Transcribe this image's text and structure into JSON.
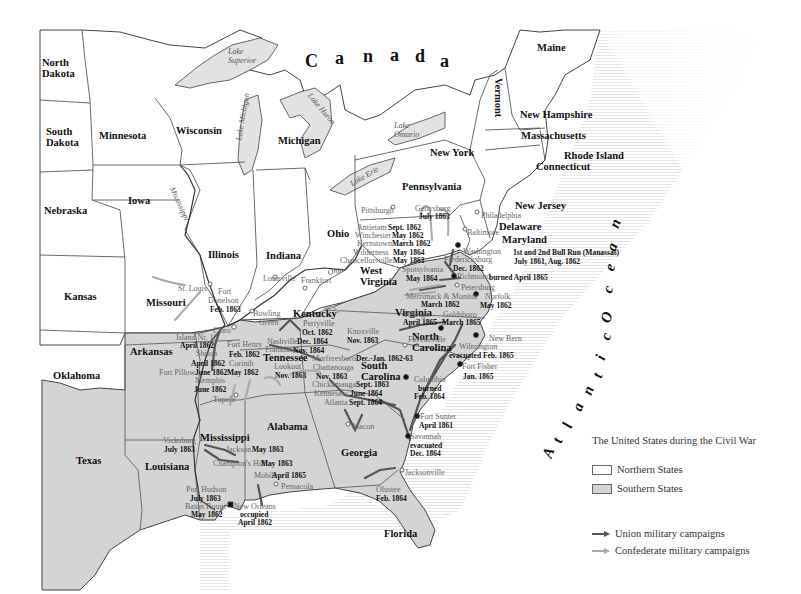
{
  "map": {
    "country_label": [
      "C",
      "a",
      "n",
      "a",
      "d",
      "a"
    ],
    "ocean_label": [
      "A",
      "t",
      "l",
      "a",
      "n",
      "t",
      "i",
      "c",
      " ",
      "O",
      "c",
      "e",
      "a",
      "n"
    ],
    "colors": {
      "northern_fill": "#ffffff",
      "southern_fill": "#d4d4d4",
      "border": "#444444",
      "lake_fill": "#e2e2e2",
      "union_arrow": "#555555",
      "confederate_arrow": "#aaaaaa"
    },
    "states": [
      {
        "name": "North Dakota",
        "x": 42,
        "y": 58,
        "lines": [
          "North",
          "Dakota"
        ]
      },
      {
        "name": "South Dakota",
        "x": 46,
        "y": 127,
        "lines": [
          "South",
          "Dakota"
        ]
      },
      {
        "name": "Minnesota",
        "x": 99,
        "y": 131,
        "lines": [
          "Minnesota"
        ]
      },
      {
        "name": "Wisconsin",
        "x": 176,
        "y": 126,
        "lines": [
          "Wisconsin"
        ]
      },
      {
        "name": "Michigan",
        "x": 278,
        "y": 136,
        "lines": [
          "Michigan"
        ]
      },
      {
        "name": "Iowa",
        "x": 128,
        "y": 196,
        "lines": [
          "Iowa"
        ]
      },
      {
        "name": "Nebraska",
        "x": 44,
        "y": 206,
        "lines": [
          "Nebraska"
        ]
      },
      {
        "name": "Illinois",
        "x": 208,
        "y": 250,
        "lines": [
          "Illinois"
        ]
      },
      {
        "name": "Indiana",
        "x": 266,
        "y": 251,
        "lines": [
          "Indiana"
        ]
      },
      {
        "name": "Ohio",
        "x": 327,
        "y": 229,
        "lines": [
          "Ohio"
        ]
      },
      {
        "name": "Pennsylvania",
        "x": 402,
        "y": 182,
        "lines": [
          "Pennsylvania"
        ]
      },
      {
        "name": "New York",
        "x": 430,
        "y": 148,
        "lines": [
          "New York"
        ]
      },
      {
        "name": "Vermont",
        "x": 503,
        "y": 78,
        "lines": [
          "Vermont"
        ],
        "rotate": 90
      },
      {
        "name": "Maine",
        "x": 537,
        "y": 43,
        "lines": [
          "Maine"
        ]
      },
      {
        "name": "New Hampshire",
        "x": 520,
        "y": 110,
        "lines": [
          "New Hampshire"
        ]
      },
      {
        "name": "Massachusetts",
        "x": 521,
        "y": 131,
        "lines": [
          "Massachusetts"
        ]
      },
      {
        "name": "Rhode Island",
        "x": 564,
        "y": 151,
        "lines": [
          "Rhode Island"
        ]
      },
      {
        "name": "Connecticut",
        "x": 536,
        "y": 162,
        "lines": [
          "Connecticut"
        ]
      },
      {
        "name": "New Jersey",
        "x": 515,
        "y": 201,
        "lines": [
          "New Jersey"
        ]
      },
      {
        "name": "Delaware",
        "x": 499,
        "y": 222,
        "lines": [
          "Delaware"
        ]
      },
      {
        "name": "Maryland",
        "x": 502,
        "y": 235,
        "lines": [
          "Maryland"
        ]
      },
      {
        "name": "West Virginia",
        "x": 360,
        "y": 266,
        "lines": [
          "West",
          "Virginia"
        ]
      },
      {
        "name": "Virginia",
        "x": 395,
        "y": 308,
        "lines": [
          "Virginia"
        ]
      },
      {
        "name": "Kansas",
        "x": 64,
        "y": 292,
        "lines": [
          "Kansas"
        ]
      },
      {
        "name": "Missouri",
        "x": 146,
        "y": 298,
        "lines": [
          "Missouri"
        ]
      },
      {
        "name": "Kentucky",
        "x": 293,
        "y": 309,
        "lines": [
          "Kentucky"
        ]
      },
      {
        "name": "North Carolina",
        "x": 412,
        "y": 332,
        "lines": [
          "North",
          "Carolina"
        ]
      },
      {
        "name": "Tennessee",
        "x": 263,
        "y": 353,
        "lines": [
          "Tennessee"
        ]
      },
      {
        "name": "South Carolina",
        "x": 361,
        "y": 361,
        "lines": [
          "South",
          "Carolina"
        ]
      },
      {
        "name": "Arkansas",
        "x": 130,
        "y": 347,
        "lines": [
          "Arkansas"
        ]
      },
      {
        "name": "Oklahoma",
        "x": 53,
        "y": 371,
        "lines": [
          "Oklahoma"
        ]
      },
      {
        "name": "Alabama",
        "x": 267,
        "y": 422,
        "lines": [
          "Alabama"
        ]
      },
      {
        "name": "Mississippi",
        "x": 200,
        "y": 433,
        "lines": [
          "Mississippi"
        ]
      },
      {
        "name": "Georgia",
        "x": 341,
        "y": 448,
        "lines": [
          "Georgia"
        ]
      },
      {
        "name": "Texas",
        "x": 76,
        "y": 456,
        "lines": [
          "Texas"
        ]
      },
      {
        "name": "Louisiana",
        "x": 145,
        "y": 462,
        "lines": [
          "Louisiana"
        ]
      },
      {
        "name": "Florida",
        "x": 384,
        "y": 529,
        "lines": [
          "Florida"
        ]
      }
    ],
    "waters": [
      {
        "name": "Lake Superior",
        "lines": [
          "Lake",
          "Superior"
        ],
        "x": 228,
        "y": 48
      },
      {
        "name": "Lake Huron",
        "lines": [
          "Lake Huron"
        ],
        "x": 312,
        "y": 92,
        "rotate": 50
      },
      {
        "name": "Lake Michigan",
        "lines": [
          "Lake Michigan"
        ],
        "x": 235,
        "y": 140,
        "rotate": -80
      },
      {
        "name": "Lake Ontario",
        "lines": [
          "Lake",
          "Ontario"
        ],
        "x": 394,
        "y": 122
      },
      {
        "name": "Lake Erie",
        "lines": [
          "Lake Erie"
        ],
        "x": 349,
        "y": 181,
        "rotate": -30
      },
      {
        "name": "Mississippi",
        "lines": [
          "Mississippi"
        ],
        "x": 175,
        "y": 186,
        "rotate": 65
      },
      {
        "name": "Ohio River",
        "lines": [
          "Ohio"
        ],
        "x": 327,
        "y": 269,
        "rotate": -10
      }
    ],
    "events": [
      {
        "place": "St. Louis",
        "x": 178,
        "y": 285
      },
      {
        "place": "Fort",
        "x": 218,
        "y": 288
      },
      {
        "place": "Donelson",
        "x": 208,
        "y": 297
      },
      {
        "date": "Feb. 1863",
        "x": 210,
        "y": 306
      },
      {
        "place": "Island Nr. 10",
        "x": 176,
        "y": 334
      },
      {
        "date": "April 1862",
        "x": 180,
        "y": 342
      },
      {
        "place": "Cairo",
        "x": 213,
        "y": 327
      },
      {
        "place": "Fort Henry",
        "x": 227,
        "y": 341
      },
      {
        "date": "Feb. 1862",
        "x": 229,
        "y": 351
      },
      {
        "place": "Shiloh",
        "x": 196,
        "y": 350
      },
      {
        "date": "April 1862",
        "x": 191,
        "y": 360
      },
      {
        "place": "Corinth",
        "x": 229,
        "y": 360
      },
      {
        "date": "May 1862",
        "x": 227,
        "y": 369
      },
      {
        "place": "Fort Pillow",
        "x": 159,
        "y": 369
      },
      {
        "date": "June 1862",
        "x": 195,
        "y": 369
      },
      {
        "place": "Memphis",
        "x": 195,
        "y": 377
      },
      {
        "date": "June 1862",
        "x": 194,
        "y": 386
      },
      {
        "place": "Tupelo",
        "x": 213,
        "y": 396
      },
      {
        "place": "Louisville",
        "x": 263,
        "y": 275
      },
      {
        "place": "Frankfort",
        "x": 301,
        "y": 277
      },
      {
        "place": "Bowling",
        "x": 253,
        "y": 310
      },
      {
        "place": "Green",
        "x": 259,
        "y": 319
      },
      {
        "place": "Perryville",
        "x": 303,
        "y": 320
      },
      {
        "date": "Oct. 1862",
        "x": 302,
        "y": 329
      },
      {
        "place": "Nashville",
        "x": 267,
        "y": 338
      },
      {
        "date": "Dec. 1864",
        "x": 297,
        "y": 338
      },
      {
        "place": "Franklin",
        "x": 265,
        "y": 346
      },
      {
        "date": "Nov. 1864",
        "x": 293,
        "y": 347
      },
      {
        "place": "Lookout",
        "x": 274,
        "y": 363
      },
      {
        "date": "Nov. 1863",
        "x": 275,
        "y": 372
      },
      {
        "place": "Murfreesboro",
        "x": 312,
        "y": 355
      },
      {
        "date": "Dec.-Jan. 1862-63",
        "x": 356,
        "y": 355
      },
      {
        "place": "Chattanooga",
        "x": 313,
        "y": 364
      },
      {
        "date": "Nov. 1863",
        "x": 316,
        "y": 373
      },
      {
        "place": "Knoxville",
        "x": 347,
        "y": 328
      },
      {
        "date": "Nov. 1863",
        "x": 347,
        "y": 337
      },
      {
        "place": "Chickamauga",
        "x": 312,
        "y": 381
      },
      {
        "date": "Sept. 1863",
        "x": 356,
        "y": 381
      },
      {
        "place": "Kennesaw",
        "x": 314,
        "y": 390
      },
      {
        "date": "June 1864",
        "x": 350,
        "y": 390
      },
      {
        "place": "Atlanta",
        "x": 324,
        "y": 399
      },
      {
        "date": "Sept. 1864",
        "x": 349,
        "y": 399
      },
      {
        "place": "Macon",
        "x": 352,
        "y": 423
      },
      {
        "place": "Pittsburgh",
        "x": 361,
        "y": 207
      },
      {
        "place": "Gettysburg",
        "x": 415,
        "y": 205
      },
      {
        "date": "July 1863",
        "x": 419,
        "y": 213
      },
      {
        "place": "Antietam",
        "x": 357,
        "y": 224
      },
      {
        "date": "Sept. 1862",
        "x": 388,
        "y": 224
      },
      {
        "place": "Winchester",
        "x": 355,
        "y": 232
      },
      {
        "date": "May 1862",
        "x": 392,
        "y": 232
      },
      {
        "place": "Kernstown",
        "x": 357,
        "y": 240
      },
      {
        "date": "March 1862",
        "x": 392,
        "y": 240
      },
      {
        "place": "Wilderness",
        "x": 353,
        "y": 249
      },
      {
        "date": "May 1864",
        "x": 393,
        "y": 249
      },
      {
        "place": "Chancellorsville",
        "x": 340,
        "y": 257
      },
      {
        "date": "May 1863",
        "x": 393,
        "y": 257
      },
      {
        "place": "Philadelphia",
        "x": 481,
        "y": 212
      },
      {
        "place": "Baltimore",
        "x": 467,
        "y": 229
      },
      {
        "place": "Washington",
        "x": 463,
        "y": 248
      },
      {
        "place": "Fredericksburg",
        "x": 444,
        "y": 256
      },
      {
        "date": "Dec. 1862",
        "x": 453,
        "y": 265
      },
      {
        "place": "Spotsylvania",
        "x": 402,
        "y": 266
      },
      {
        "date": "May 1864",
        "x": 406,
        "y": 275
      },
      {
        "place": "Richmond",
        "x": 457,
        "y": 273
      },
      {
        "place": "Petersburg",
        "x": 461,
        "y": 284
      },
      {
        "place": "Merrimack & Monitor",
        "x": 406,
        "y": 293
      },
      {
        "date": "March 1862",
        "x": 421,
        "y": 301
      },
      {
        "place": "Norfolk",
        "x": 485,
        "y": 293
      },
      {
        "date": "May 1862",
        "x": 480,
        "y": 302
      },
      {
        "place": "Raleigh",
        "x": 404,
        "y": 311
      },
      {
        "date": "April 1865",
        "x": 403,
        "y": 319
      },
      {
        "place": "Goldsboro",
        "x": 443,
        "y": 311
      },
      {
        "date": "March 1865",
        "x": 442,
        "y": 319
      },
      {
        "place": "Fayetteville",
        "x": 408,
        "y": 336
      },
      {
        "place": "New Bern",
        "x": 489,
        "y": 335
      },
      {
        "place": "Wilmington",
        "x": 459,
        "y": 343
      },
      {
        "place": "Fort Fisher",
        "x": 462,
        "y": 363
      },
      {
        "date": "Jan. 1865",
        "x": 463,
        "y": 373
      },
      {
        "date": "evacuated Feb. 1865",
        "x": 449,
        "y": 352
      },
      {
        "place": "Columbia",
        "x": 414,
        "y": 376
      },
      {
        "date": "burned",
        "x": 418,
        "y": 385
      },
      {
        "date": "Feb. 1864",
        "x": 414,
        "y": 393
      },
      {
        "place": "Fort Sunter",
        "x": 420,
        "y": 413
      },
      {
        "date": "April 1861",
        "x": 419,
        "y": 422
      },
      {
        "place": "Savannah",
        "x": 410,
        "y": 433
      },
      {
        "date": "evacuated",
        "x": 410,
        "y": 442
      },
      {
        "date": "Dec. 1864",
        "x": 410,
        "y": 450
      },
      {
        "place": "Jacksonville",
        "x": 405,
        "y": 469
      },
      {
        "place": "Olustee",
        "x": 376,
        "y": 486
      },
      {
        "date": "Feb. 1864",
        "x": 376,
        "y": 495
      },
      {
        "place": "Vicksburg",
        "x": 163,
        "y": 437
      },
      {
        "date": "July 1863",
        "x": 164,
        "y": 446
      },
      {
        "place": "Jackson",
        "x": 226,
        "y": 446
      },
      {
        "date": "May 1863",
        "x": 252,
        "y": 446
      },
      {
        "place": "Champion's Hill",
        "x": 213,
        "y": 460
      },
      {
        "date": "May 1863",
        "x": 261,
        "y": 460
      },
      {
        "place": "Mobile",
        "x": 254,
        "y": 472
      },
      {
        "date": "April 1865",
        "x": 272,
        "y": 472
      },
      {
        "place": "Pensacola",
        "x": 281,
        "y": 483
      },
      {
        "place": "Port Hudson",
        "x": 186,
        "y": 486
      },
      {
        "date": "July 1863",
        "x": 190,
        "y": 495
      },
      {
        "place": "Baton Rouge",
        "x": 185,
        "y": 503
      },
      {
        "date": "May 1862",
        "x": 191,
        "y": 511
      },
      {
        "place": "New Orleans",
        "x": 234,
        "y": 503
      },
      {
        "date": "occupied",
        "x": 240,
        "y": 511
      },
      {
        "date": "April 1862",
        "x": 238,
        "y": 519
      },
      {
        "date": "1st and 2nd Bull Run (Manassas)",
        "x": 513,
        "y": 249
      },
      {
        "date": "July 1861, Aug. 1862",
        "x": 514,
        "y": 258
      },
      {
        "date": "burned April 1865",
        "x": 489,
        "y": 274
      }
    ]
  },
  "legend": {
    "title": "The United States during the Civil War",
    "items": [
      {
        "label": "Northern States",
        "kind": "swatch",
        "color": "#ffffff"
      },
      {
        "label": "Southern States",
        "kind": "swatch",
        "color": "#d4d4d4"
      },
      {
        "label": "Union military campaigns",
        "kind": "arrow",
        "color": "#555555"
      },
      {
        "label": "Confederate military campaigns",
        "kind": "arrow",
        "color": "#aaaaaa"
      }
    ]
  }
}
